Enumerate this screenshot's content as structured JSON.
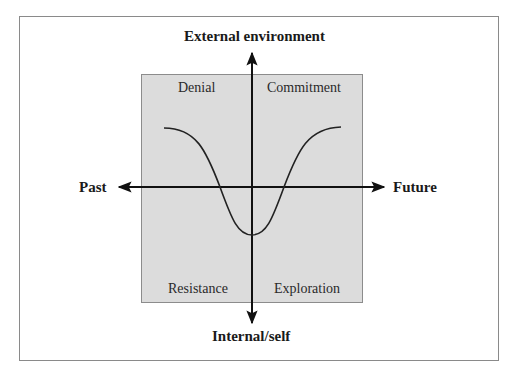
{
  "diagram": {
    "axes": {
      "top": "External environment",
      "bottom": "Internal/self",
      "left": "Past",
      "right": "Future"
    },
    "quadrants": {
      "top_left": "Denial",
      "top_right": "Commitment",
      "bottom_left": "Resistance",
      "bottom_right": "Exploration"
    },
    "curve": {
      "shape": "inverted-bell (U-shaped dip)",
      "description": "Curve starts high at left (Denial), dips below the horizontal axis through Resistance, bottoms near the vertical axis, rises through Exploration and levels off high at right (Commitment)"
    },
    "colors": {
      "box_fill": "#dcdcdc",
      "line": "#111111",
      "frame": "#8a8a8a"
    }
  }
}
